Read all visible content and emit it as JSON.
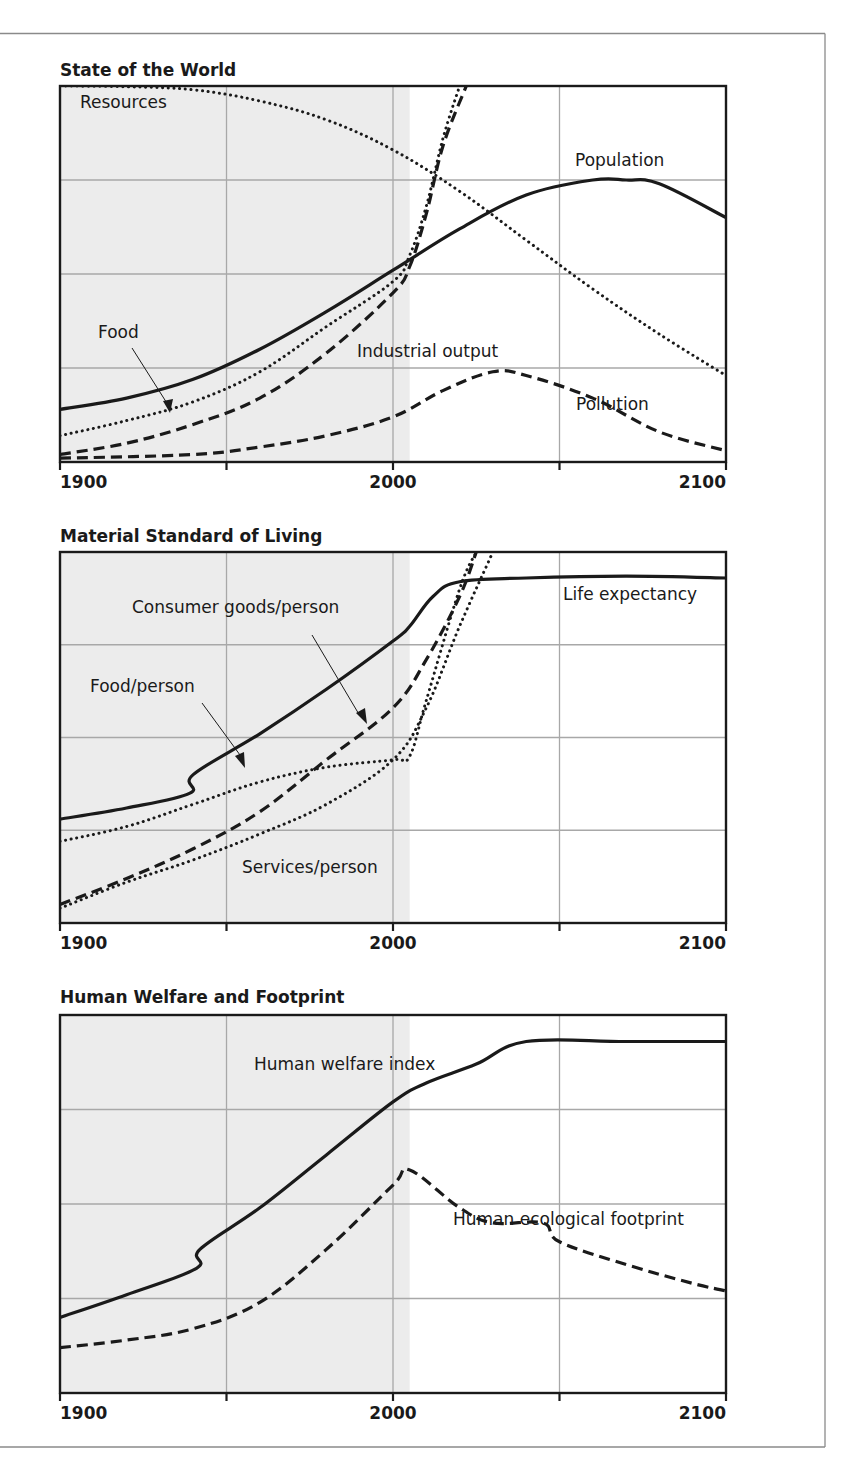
{
  "figure": {
    "shade_end_year": 2005,
    "colors": {
      "line": "#1a1a1a",
      "grid": "#a8a8a8",
      "shade": "#ececec",
      "frame": "#8a8a8a",
      "background": "#ffffff"
    }
  },
  "chart_data": [
    {
      "type": "line",
      "title": "State of the World",
      "xlabel": "",
      "ylabel": "",
      "x_ticks": [
        1900,
        2000,
        2100
      ],
      "x_tick_labels": [
        "1900",
        "2000",
        "2100"
      ],
      "xlim": [
        1900,
        2100
      ],
      "ylim": [
        0,
        100
      ],
      "grid": true,
      "shaded_region": [
        1900,
        2005
      ],
      "series": [
        {
          "name": "Resources",
          "style": "dotted",
          "x": [
            1900,
            1920,
            1940,
            1960,
            1980,
            2000,
            2020,
            2040,
            2060,
            2080,
            2100
          ],
          "y": [
            100,
            99.8,
            99,
            96,
            91,
            83,
            72,
            59,
            46,
            34,
            23
          ]
        },
        {
          "name": "Population",
          "style": "solid",
          "x": [
            1900,
            1920,
            1940,
            1960,
            1980,
            2000,
            2020,
            2040,
            2060,
            2070,
            2080,
            2100
          ],
          "y": [
            14,
            17,
            22,
            30,
            40,
            51,
            62,
            71,
            75,
            75,
            74,
            65
          ]
        },
        {
          "name": "Food",
          "style": "dotted",
          "x": [
            1900,
            1920,
            1940,
            1960,
            1980,
            2000,
            2005,
            2010,
            2015,
            2020
          ],
          "y": [
            7,
            11,
            16,
            24,
            36,
            48,
            55,
            68,
            86,
            100
          ]
        },
        {
          "name": "Industrial output",
          "style": "dashed",
          "x": [
            1900,
            1920,
            1940,
            1960,
            1980,
            2000,
            2005,
            2010,
            2015,
            2022
          ],
          "y": [
            2,
            5,
            10,
            17,
            29,
            45,
            52,
            66,
            84,
            100
          ]
        },
        {
          "name": "Pollution",
          "style": "dashed",
          "x": [
            1900,
            1940,
            1960,
            1980,
            2000,
            2015,
            2030,
            2040,
            2060,
            2080,
            2100
          ],
          "y": [
            1,
            2,
            4,
            7,
            12,
            19,
            24,
            23,
            17,
            8,
            3
          ]
        }
      ],
      "annotations": [
        "Resources",
        "Population",
        "Food",
        "Industrial output",
        "Pollution"
      ]
    },
    {
      "type": "line",
      "title": "Material Standard of Living",
      "xlabel": "",
      "ylabel": "",
      "x_ticks": [
        1900,
        2000,
        2100
      ],
      "x_tick_labels": [
        "1900",
        "2000",
        "2100"
      ],
      "xlim": [
        1900,
        2100
      ],
      "ylim": [
        0,
        100
      ],
      "grid": true,
      "shaded_region": [
        1900,
        2005
      ],
      "series": [
        {
          "name": "Life expectancy",
          "style": "solid",
          "x": [
            1900,
            1920,
            1939,
            1940,
            1960,
            1980,
            2000,
            2005,
            2012,
            2020,
            2040,
            2070,
            2100
          ],
          "y": [
            28,
            31,
            35,
            40,
            51,
            63,
            76,
            80,
            88,
            92,
            93,
            93.5,
            93
          ]
        },
        {
          "name": "Food/person",
          "style": "dotted",
          "x": [
            1900,
            1920,
            1940,
            1960,
            1980,
            2000,
            2005,
            2010,
            2020,
            2025
          ],
          "y": [
            22,
            26,
            32,
            38,
            42,
            44,
            45,
            60,
            90,
            100
          ]
        },
        {
          "name": "Consumer goods/person",
          "style": "dashed",
          "x": [
            1900,
            1920,
            1940,
            1960,
            1980,
            2000,
            2010,
            2020,
            2025
          ],
          "y": [
            5,
            12,
            20,
            30,
            44,
            58,
            71,
            88,
            100
          ]
        },
        {
          "name": "Services/person",
          "style": "dotted",
          "x": [
            1900,
            1920,
            1940,
            1960,
            1980,
            2000,
            2010,
            2020,
            2030
          ],
          "y": [
            4,
            11,
            17,
            24,
            32,
            44,
            58,
            80,
            100
          ]
        }
      ],
      "annotations": [
        "Consumer goods/person",
        "Food/person",
        "Life expectancy",
        "Services/person"
      ]
    },
    {
      "type": "line",
      "title": "Human Welfare and Footprint",
      "xlabel": "",
      "ylabel": "",
      "x_ticks": [
        1900,
        2000,
        2100
      ],
      "x_tick_labels": [
        "1900",
        "2000",
        "2100"
      ],
      "xlim": [
        1900,
        2100
      ],
      "ylim": [
        0,
        100
      ],
      "grid": true,
      "shaded_region": [
        1900,
        2005
      ],
      "series": [
        {
          "name": "Human welfare index",
          "style": "solid",
          "x": [
            1900,
            1920,
            1941,
            1942,
            1960,
            1980,
            2000,
            2010,
            2025,
            2040,
            2070,
            2100
          ],
          "y": [
            20,
            26,
            33,
            38,
            49,
            63,
            77,
            82,
            87,
            93,
            93,
            93
          ]
        },
        {
          "name": "Human ecological footprint",
          "style": "dashed",
          "x": [
            1900,
            1920,
            1940,
            1960,
            1980,
            2000,
            2005,
            2020,
            2030,
            2045,
            2050,
            2070,
            2090,
            2100
          ],
          "y": [
            12,
            14,
            17,
            24,
            38,
            55,
            59,
            49,
            45,
            45,
            40,
            34,
            29,
            27
          ]
        }
      ],
      "annotations": [
        "Human welfare index",
        "Human ecological footprint"
      ]
    }
  ]
}
